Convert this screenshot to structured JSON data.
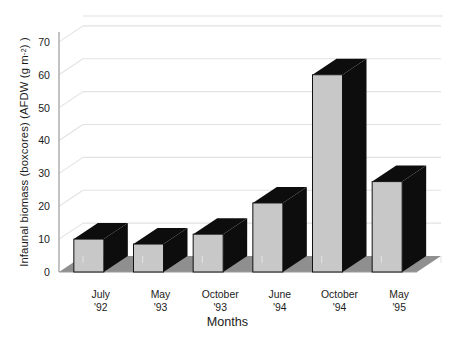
{
  "chart_data": {
    "type": "bar",
    "title": "",
    "xlabel": "Months",
    "ylabel": "Infaunal biomass (boxcores) (AFDW (g m-2) )",
    "ylabel_parts": {
      "prefix": "Infaunal biomass (boxcores) (AFDW (g m",
      "superscript": "-2",
      "suffix": ") )"
    },
    "categories": [
      "July '92",
      "May '93",
      "October '93",
      "June '94",
      "October '94",
      "May '95"
    ],
    "category_lines": [
      {
        "month": "July",
        "year": "'92"
      },
      {
        "month": "May",
        "year": "'93"
      },
      {
        "month": "October",
        "year": "'93"
      },
      {
        "month": "June",
        "year": "'94"
      },
      {
        "month": "October",
        "year": "'94"
      },
      {
        "month": "May",
        "year": "'95"
      }
    ],
    "values": [
      10,
      8.5,
      11.5,
      21,
      60,
      27.5
    ],
    "ylim": [
      0,
      73
    ],
    "yticks": [
      0,
      10,
      20,
      30,
      40,
      50,
      60,
      70
    ],
    "ytick_labels": [
      "0",
      "10",
      "20",
      "30",
      "40",
      "50",
      "60",
      "70"
    ],
    "grid": true,
    "grid_axis": "y",
    "legend": "none",
    "style": "3d",
    "colors": {
      "bar_front": "#c8c8c8",
      "bar_top": "#0d0d0d",
      "bar_side": "#0d0d0d",
      "bar_outline": "#111111",
      "floor": "#8f8f8f",
      "gridline": "#e2e2e2",
      "axis": "#9a9a9a",
      "text": "#1b1b1b",
      "background": "#ffffff"
    }
  }
}
